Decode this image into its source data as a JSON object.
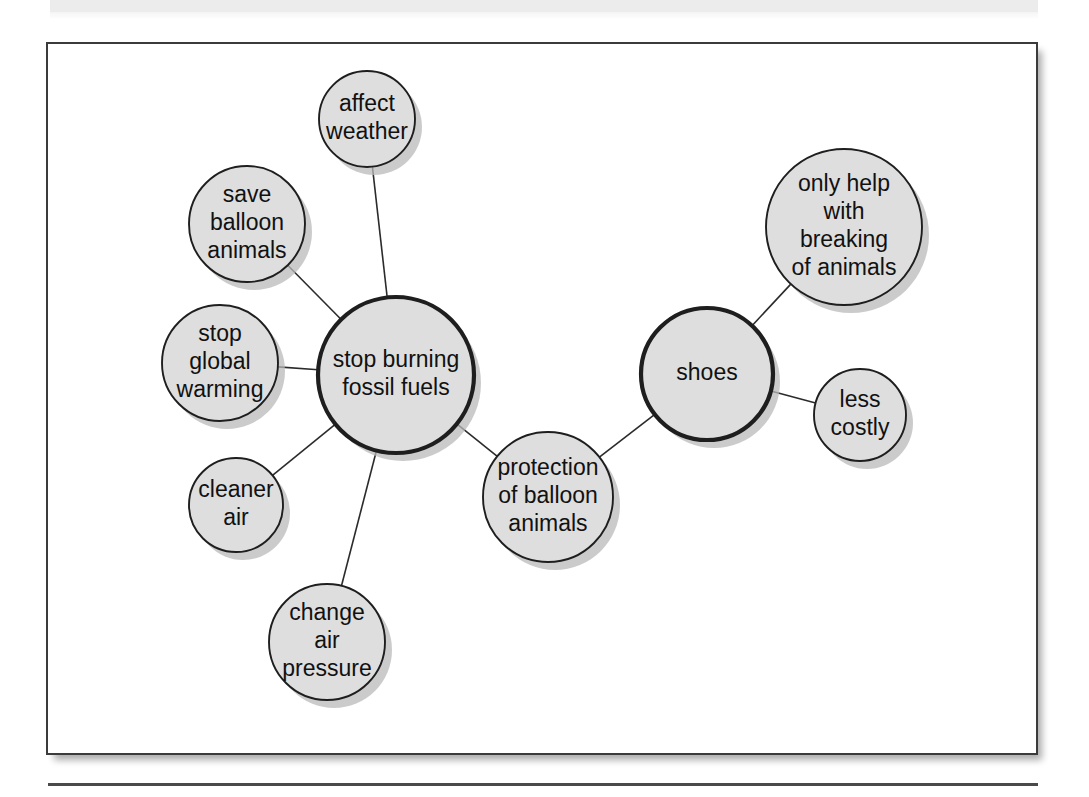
{
  "figure": {
    "kind": "concept-map",
    "caption": "",
    "background_color": "#ffffff",
    "frame_color": "#3b3b3b",
    "node_fill_color": "#dedede",
    "node_stroke_color": "#1e1e1e",
    "edge_color": "#2b2b2b",
    "shadow_color": "#b9b9b9"
  },
  "chart_data": {
    "type": "diagram",
    "title": "",
    "nodes": [
      {
        "id": "affect_weather",
        "label": "affect weather",
        "lines": [
          "affect",
          "weather"
        ],
        "cx": 319,
        "cy": 75,
        "r": 48,
        "emphasis": false
      },
      {
        "id": "save_balloon",
        "label": "save balloon animals",
        "lines": [
          "save",
          "balloon",
          "animals"
        ],
        "cx": 199,
        "cy": 180,
        "r": 58,
        "emphasis": false
      },
      {
        "id": "stop_global",
        "label": "stop global warming",
        "lines": [
          "stop",
          "global",
          "warming"
        ],
        "cx": 172,
        "cy": 319,
        "r": 58,
        "emphasis": false
      },
      {
        "id": "fossil_fuels",
        "label": "stop burning fossil fuels",
        "lines": [
          "stop burning",
          "fossil fuels"
        ],
        "cx": 348,
        "cy": 331,
        "r": 78,
        "emphasis": true
      },
      {
        "id": "cleaner_air",
        "label": "cleaner air",
        "lines": [
          "cleaner",
          "air"
        ],
        "cx": 188,
        "cy": 461,
        "r": 47,
        "emphasis": false
      },
      {
        "id": "change_pressure",
        "label": "change air pressure",
        "lines": [
          "change",
          "air",
          "pressure"
        ],
        "cx": 279,
        "cy": 598,
        "r": 58,
        "emphasis": false
      },
      {
        "id": "protection",
        "label": "protection of balloon animals",
        "lines": [
          "protection",
          "of balloon",
          "animals"
        ],
        "cx": 500,
        "cy": 453,
        "r": 65,
        "emphasis": false
      },
      {
        "id": "shoes",
        "label": "shoes",
        "lines": [
          "shoes"
        ],
        "cx": 659,
        "cy": 330,
        "r": 66,
        "emphasis": true
      },
      {
        "id": "only_help",
        "label": "only help with breaking of animals",
        "lines": [
          "only help",
          "with",
          "breaking",
          "of animals"
        ],
        "cx": 796,
        "cy": 183,
        "r": 78,
        "emphasis": false
      },
      {
        "id": "less_costly",
        "label": "less costly",
        "lines": [
          "less",
          "costly"
        ],
        "cx": 812,
        "cy": 371,
        "r": 46,
        "emphasis": false
      }
    ],
    "edges": [
      {
        "from": "fossil_fuels",
        "to": "affect_weather"
      },
      {
        "from": "fossil_fuels",
        "to": "save_balloon"
      },
      {
        "from": "fossil_fuels",
        "to": "stop_global"
      },
      {
        "from": "fossil_fuels",
        "to": "cleaner_air"
      },
      {
        "from": "fossil_fuels",
        "to": "change_pressure"
      },
      {
        "from": "fossil_fuels",
        "to": "protection"
      },
      {
        "from": "protection",
        "to": "shoes"
      },
      {
        "from": "shoes",
        "to": "only_help"
      },
      {
        "from": "shoes",
        "to": "less_costly"
      }
    ]
  }
}
